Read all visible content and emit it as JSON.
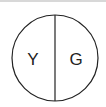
{
  "diagram": {
    "shape": "circle-divided-vertically",
    "left_label": "Y",
    "right_label": "G",
    "stroke_color": "#222222",
    "background": "#ffffff",
    "top_border_color": "#d8d8d8"
  }
}
